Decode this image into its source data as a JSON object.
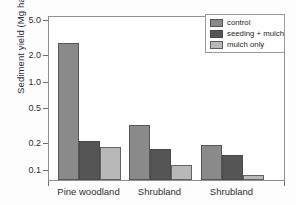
{
  "chart_data": {
    "type": "bar",
    "title": "",
    "xlabel": "",
    "ylabel": "Sediment yield (Mg ha⁻¹ yr⁻¹)",
    "ylabel_parts": {
      "prefix": "Sediment yield (Mg ha",
      "exp1": "-1",
      "mid": " yr",
      "exp2": "-1",
      "suffix": ")"
    },
    "yscale": "log",
    "ylim": [
      0.075,
      5.6
    ],
    "yticks": [
      0.1,
      0.2,
      0.5,
      1.0,
      2.0,
      5.0
    ],
    "ytick_labels": [
      "0.1",
      "0.2",
      "0.5",
      "1.0",
      "2.0",
      "5.0"
    ],
    "grid": false,
    "legend_position": "top-right",
    "categories": [
      "Pine woodland",
      "Shrubland",
      "Shrubland"
    ],
    "series": [
      {
        "name": "control",
        "color": "#8a8a8a",
        "values": [
          2.7,
          0.32,
          0.185
        ]
      },
      {
        "name": "seeding + mulch",
        "color": "#555555",
        "values": [
          0.21,
          0.17,
          0.145
        ]
      },
      {
        "name": "mulch only",
        "color": "#b8b8b8",
        "values": [
          0.18,
          0.11,
          0.085
        ]
      }
    ]
  },
  "legend": {
    "items": [
      {
        "label": "control",
        "color": "#8a8a8a"
      },
      {
        "label": "seeding + mulch",
        "color": "#555555"
      },
      {
        "label": "mulch only",
        "color": "#b8b8b8"
      }
    ]
  }
}
